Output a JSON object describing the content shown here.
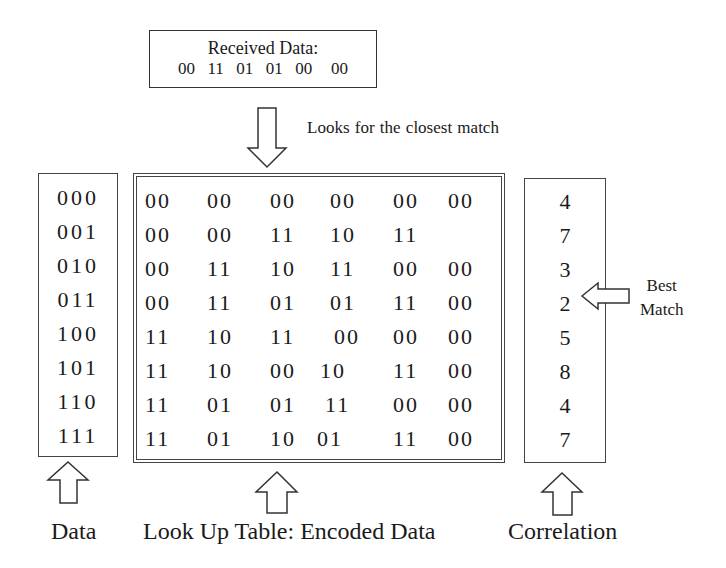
{
  "received": {
    "title": "Received Data:",
    "bits": "00  11  01  01  00   00"
  },
  "annotations": {
    "search_caption": "Looks for the closest match",
    "best_match_line1": "Best",
    "best_match_line2": "Match"
  },
  "data_column": {
    "label": "Data",
    "rows": [
      "000",
      "001",
      "010",
      "011",
      "100",
      "101",
      "110",
      "111"
    ]
  },
  "lookup_table": {
    "label": "Look Up Table: Encoded Data",
    "rows": [
      [
        "00",
        "00",
        "00",
        "00",
        "00",
        "00"
      ],
      [
        "00",
        "00",
        "11",
        "10",
        "11",
        ""
      ],
      [
        "00",
        "11",
        "10",
        "11",
        "00",
        "00"
      ],
      [
        "00",
        "11",
        "01",
        "01",
        "11",
        "00"
      ],
      [
        "11",
        "10",
        "11",
        "00",
        "00",
        "00"
      ],
      [
        "11",
        "10",
        "00",
        "10",
        "11",
        "00"
      ],
      [
        "11",
        "01",
        "01",
        "11",
        "00",
        "00"
      ],
      [
        "11",
        "01",
        "10",
        "01",
        "11",
        "00"
      ]
    ]
  },
  "correlation": {
    "label": "Correlation",
    "values": [
      "4",
      "7",
      "3",
      "2",
      "5",
      "8",
      "4",
      "7"
    ],
    "best_match_index": 3
  }
}
